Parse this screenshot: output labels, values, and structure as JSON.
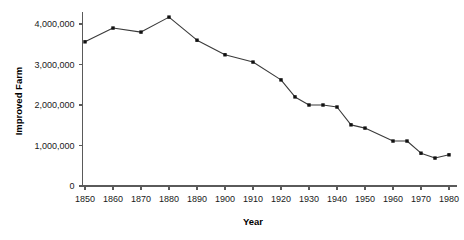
{
  "chart_data": {
    "type": "line",
    "title": "",
    "xlabel": "Year",
    "ylabel": "Improved Farm",
    "xlim": [
      1845,
      1985
    ],
    "ylim": [
      0,
      4500000
    ],
    "grid": false,
    "legend": null,
    "x_ticks": [
      1850,
      1860,
      1870,
      1880,
      1890,
      1900,
      1910,
      1920,
      1930,
      1940,
      1950,
      1960,
      1970,
      1980
    ],
    "x_tick_labels": [
      "1850",
      "1860",
      "1870",
      "1880",
      "1890",
      "1900",
      "1910",
      "1920",
      "1930",
      "1940",
      "1950",
      "1960",
      "1970",
      "1980"
    ],
    "y_ticks": [
      0,
      1000000,
      2000000,
      3000000,
      4000000
    ],
    "y_tick_labels": [
      "0",
      "1,000,000",
      "2,000,000",
      "3,000,000",
      "4,000,000"
    ],
    "marker": "filled-square",
    "line_color": "#3a3a3a",
    "marker_color": "#111111",
    "x": [
      1850,
      1860,
      1870,
      1880,
      1890,
      1900,
      1910,
      1920,
      1925,
      1930,
      1935,
      1940,
      1945,
      1950,
      1960,
      1965,
      1970,
      1975,
      1980
    ],
    "values": [
      3560000,
      3900000,
      3800000,
      4170000,
      3600000,
      3240000,
      3060000,
      2620000,
      2200000,
      2000000,
      2000000,
      1950000,
      1510000,
      1430000,
      1110000,
      1110000,
      810000,
      690000,
      770000
    ],
    "series": [
      {
        "name": "Improved Farm",
        "x": [
          1850,
          1860,
          1870,
          1880,
          1890,
          1900,
          1910,
          1920,
          1925,
          1930,
          1935,
          1940,
          1945,
          1950,
          1960,
          1965,
          1970,
          1975,
          1980
        ],
        "values": [
          3560000,
          3900000,
          3800000,
          4170000,
          3600000,
          3240000,
          3060000,
          2620000,
          2200000,
          2000000,
          2000000,
          1950000,
          1510000,
          1430000,
          1110000,
          1110000,
          810000,
          690000,
          770000
        ]
      }
    ]
  }
}
